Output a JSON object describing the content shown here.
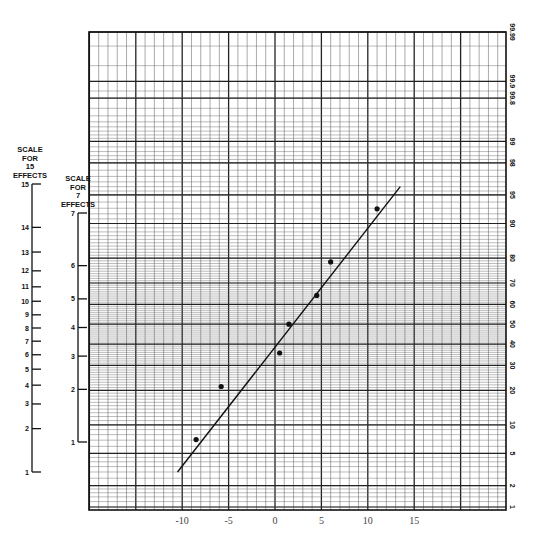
{
  "chart_data": {
    "type": "scatter",
    "title": "",
    "subtitle": "Normal probability plot of effects",
    "xlabel": "",
    "ylabel": "",
    "x_ticks": [
      -10,
      -5,
      0,
      5,
      10,
      15
    ],
    "xlim": [
      -20,
      24
    ],
    "right_axis": {
      "label": "Cumulative probability (%)",
      "ticks": [
        1,
        2,
        5,
        10,
        20,
        30,
        40,
        50,
        60,
        70,
        80,
        90,
        95,
        98,
        99,
        99.8,
        99.9,
        99.99
      ],
      "tick_labels": [
        "1",
        "2",
        "5",
        "10",
        "20",
        "30",
        "40",
        "50",
        "60",
        "70",
        "80",
        "90",
        "95",
        "98",
        "99",
        "99.8",
        "99.9",
        "99.99"
      ]
    },
    "left_scales": [
      {
        "title": [
          "SCALE",
          "FOR",
          "15",
          "EFFECTS"
        ],
        "ticks": [
          1,
          2,
          3,
          4,
          5,
          6,
          7,
          8,
          9,
          10,
          11,
          12,
          13,
          14,
          15
        ]
      },
      {
        "title": [
          "SCALE",
          "FOR",
          "7",
          "EFFECTS"
        ],
        "ticks": [
          1,
          2,
          3,
          4,
          5,
          6,
          7
        ]
      }
    ],
    "series": [
      {
        "name": "effects",
        "points": [
          {
            "x": -8.5,
            "rank": 1,
            "p": 7.1
          },
          {
            "x": -5.8,
            "rank": 2,
            "p": 21.4
          },
          {
            "x": 0.5,
            "rank": 3,
            "p": 35.7
          },
          {
            "x": 1.5,
            "rank": 4,
            "p": 50.0
          },
          {
            "x": 4.5,
            "rank": 5,
            "p": 64.3
          },
          {
            "x": 6.0,
            "rank": 6,
            "p": 78.6
          },
          {
            "x": 11.0,
            "rank": 7,
            "p": 92.9
          }
        ]
      }
    ],
    "fit_line": {
      "x_start": -10.5,
      "p_start": 3.0,
      "x_end": 13.5,
      "p_end": 96.0
    },
    "grid": true,
    "legend": "none"
  },
  "labels": {
    "scale15_title": [
      "SCALE",
      "FOR",
      "15",
      "EFFECTS"
    ],
    "scale7_title": [
      "SCALE",
      "FOR",
      "7",
      "EFFECTS"
    ]
  }
}
